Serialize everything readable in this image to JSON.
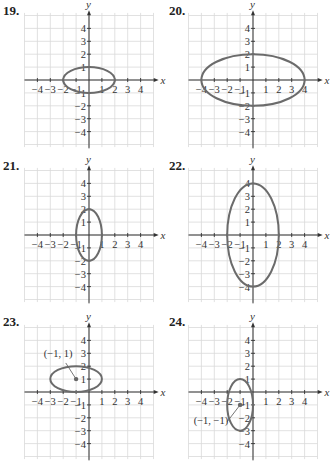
{
  "chart_data": [
    {
      "type": "ellipse-graph",
      "problem": "19.",
      "xlabel": "x",
      "ylabel": "y",
      "xlim": [
        -5,
        5
      ],
      "ylim": [
        -5,
        5
      ],
      "x_ticks": [
        "−4",
        "−3",
        "−2",
        "−1",
        "1",
        "2",
        "3",
        "4"
      ],
      "y_ticks": [
        "4",
        "3",
        "2",
        "1",
        "−1",
        "−2",
        "−3",
        "−4"
      ],
      "ellipse": {
        "center": [
          0,
          0
        ],
        "rx": 2,
        "ry": 1
      },
      "annotation": null
    },
    {
      "type": "ellipse-graph",
      "problem": "20.",
      "xlabel": "x",
      "ylabel": "y",
      "xlim": [
        -5,
        5
      ],
      "ylim": [
        -5,
        5
      ],
      "x_ticks": [
        "−4",
        "−3",
        "−2",
        "−1",
        "1",
        "2",
        "3",
        "4"
      ],
      "y_ticks": [
        "4",
        "3",
        "2",
        "1",
        "−1",
        "−2",
        "−3",
        "−4"
      ],
      "ellipse": {
        "center": [
          0,
          0
        ],
        "rx": 4,
        "ry": 2
      },
      "annotation": null
    },
    {
      "type": "ellipse-graph",
      "problem": "21.",
      "xlabel": "x",
      "ylabel": "y",
      "xlim": [
        -5,
        5
      ],
      "ylim": [
        -5,
        5
      ],
      "x_ticks": [
        "−4",
        "−3",
        "−2",
        "−1",
        "1",
        "2",
        "3",
        "4"
      ],
      "y_ticks": [
        "4",
        "3",
        "2",
        "1",
        "−1",
        "−2",
        "−3",
        "−4"
      ],
      "ellipse": {
        "center": [
          0,
          0
        ],
        "rx": 1,
        "ry": 2
      },
      "annotation": null
    },
    {
      "type": "ellipse-graph",
      "problem": "22.",
      "xlabel": "x",
      "ylabel": "y",
      "xlim": [
        -5,
        5
      ],
      "ylim": [
        -5,
        5
      ],
      "x_ticks": [
        "−4",
        "−3",
        "−2",
        "−1",
        "1",
        "2",
        "3",
        "4"
      ],
      "y_ticks": [
        "4",
        "3",
        "2",
        "1",
        "−1",
        "−2",
        "−3",
        "−4"
      ],
      "ellipse": {
        "center": [
          0,
          0
        ],
        "rx": 2,
        "ry": 4
      },
      "annotation": null
    },
    {
      "type": "ellipse-graph",
      "problem": "23.",
      "xlabel": "x",
      "ylabel": "y",
      "xlim": [
        -5,
        5
      ],
      "ylim": [
        -5,
        5
      ],
      "x_ticks": [
        "−4",
        "−3",
        "−2",
        "−1",
        "1",
        "2",
        "3",
        "4"
      ],
      "y_ticks": [
        "4",
        "3",
        "2",
        "1",
        "−1",
        "−2",
        "−3",
        "−4"
      ],
      "ellipse": {
        "center": [
          -1,
          1
        ],
        "rx": 2,
        "ry": 1
      },
      "annotation": "(−1, 1)"
    },
    {
      "type": "ellipse-graph",
      "problem": "24.",
      "xlabel": "x",
      "ylabel": "y",
      "xlim": [
        -5,
        5
      ],
      "ylim": [
        -5,
        5
      ],
      "x_ticks": [
        "−4",
        "−3",
        "−2",
        "−1",
        "1",
        "2",
        "3",
        "4"
      ],
      "y_ticks": [
        "4",
        "3",
        "2",
        "1",
        "−1",
        "−2",
        "−3",
        "−4"
      ],
      "ellipse": {
        "center": [
          -1,
          -1
        ],
        "rx": 1,
        "ry": 2
      },
      "annotation": "(−1, −1)"
    }
  ],
  "panels": [
    {
      "number": "19.",
      "x_label": "x",
      "y_label": "y"
    },
    {
      "number": "20.",
      "x_label": "x",
      "y_label": "y"
    },
    {
      "number": "21.",
      "x_label": "x",
      "y_label": "y"
    },
    {
      "number": "22.",
      "x_label": "x",
      "y_label": "y"
    },
    {
      "number": "23.",
      "x_label": "x",
      "y_label": "y",
      "annotation": "(−1, 1)"
    },
    {
      "number": "24.",
      "x_label": "x",
      "y_label": "y",
      "annotation": "(−1, −1)"
    }
  ],
  "colors": {
    "curve": "#6b6b6b",
    "grid": "#d9d9d9",
    "axis": "#333333"
  }
}
